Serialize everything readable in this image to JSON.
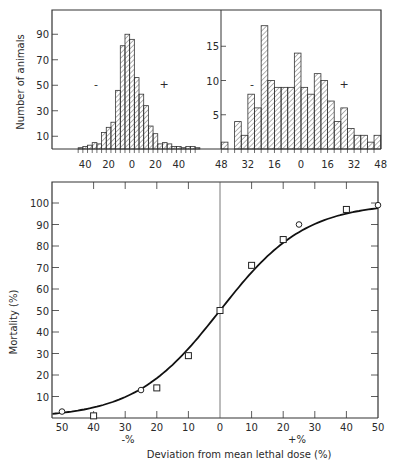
{
  "chart_data": [
    {
      "type": "bar",
      "title": "",
      "xlabel": "",
      "ylabel": "Number of animals",
      "xticks": [
        "40",
        "20",
        "0",
        "20",
        "40"
      ],
      "yticks": [
        "10",
        "30",
        "50",
        "70",
        "90"
      ],
      "ylim": [
        0,
        105
      ],
      "annotations": [
        "-",
        "+"
      ],
      "bin_width": 4,
      "x_start": -46,
      "values": [
        1,
        2,
        3,
        5,
        4,
        13,
        17,
        21,
        46,
        81,
        90,
        86,
        56,
        43,
        34,
        18,
        12,
        4,
        5,
        4,
        2,
        2,
        1,
        2,
        2,
        1
      ]
    },
    {
      "type": "bar",
      "title": "",
      "xlabel": "",
      "ylabel": "",
      "xticks": [
        "48",
        "32",
        "16",
        "0",
        "16",
        "32",
        "48"
      ],
      "yticks": [
        "5",
        "10",
        "15"
      ],
      "ylim": [
        0,
        20
      ],
      "annotations": [
        "-",
        "+"
      ],
      "bin_width": 4,
      "x_start": -48,
      "values": [
        1,
        0,
        4,
        2,
        8,
        6,
        18,
        10,
        9,
        9,
        9,
        14,
        9,
        8,
        11,
        10,
        7,
        4,
        6,
        3,
        2,
        2,
        1,
        2
      ]
    },
    {
      "type": "scatter",
      "title": "",
      "xlabel": "Deviation from mean lethal dose (%)",
      "ylabel": "Mortality (%)",
      "xticks": [
        "50",
        "40",
        "30",
        "20",
        "10",
        "0",
        "10",
        "20",
        "30",
        "40",
        "50"
      ],
      "yticks": [
        "10",
        "20",
        "30",
        "40",
        "50",
        "60",
        "70",
        "80",
        "90",
        "100"
      ],
      "xlim": [
        -53,
        50
      ],
      "ylim": [
        0,
        110
      ],
      "sublabels": [
        "-%",
        "+%"
      ],
      "series": [
        {
          "name": "squares",
          "marker": "square",
          "x": [
            -40,
            -20,
            -10,
            0,
            10,
            20,
            40
          ],
          "y": [
            1,
            14,
            29,
            50,
            71,
            83,
            97
          ]
        },
        {
          "name": "circles",
          "marker": "circle",
          "x": [
            -50,
            -25,
            25,
            50
          ],
          "y": [
            3,
            13,
            90,
            99
          ]
        },
        {
          "name": "fitted curve",
          "marker": "line",
          "x": [
            -53,
            -40,
            -30,
            -20,
            -10,
            0,
            10,
            20,
            30,
            40,
            50
          ],
          "y": [
            0,
            3,
            8,
            17,
            30,
            50,
            70,
            84,
            93,
            97.5,
            99
          ]
        }
      ]
    }
  ],
  "labels": {
    "top_ylabel": "Number of animals",
    "main_ylabel": "Mortality (%)",
    "main_xlabel": "Deviation from mean lethal dose (%)",
    "minus_pct": "-%",
    "plus_pct": "+%",
    "minus": "-",
    "plus": "+"
  }
}
